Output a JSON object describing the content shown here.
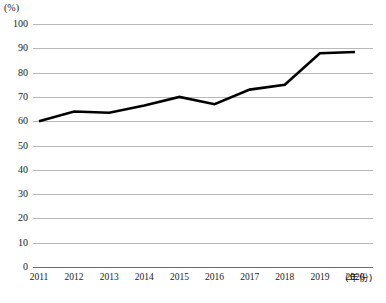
{
  "chart_data": {
    "type": "line",
    "title": "",
    "xlabel": "(年份)",
    "ylabel": "(%)",
    "categories": [
      "2011",
      "2012",
      "2013",
      "2014",
      "2015",
      "2016",
      "2017",
      "2018",
      "2019",
      "2020"
    ],
    "values": [
      60,
      64,
      63.5,
      66.5,
      70,
      67,
      73,
      75,
      88,
      88.5
    ],
    "ylim": [
      0,
      100
    ],
    "ytick_labels": [
      "100",
      "90",
      "80",
      "70",
      "60",
      "50",
      "40",
      "30",
      "20",
      "10",
      "0"
    ],
    "ytick_values": [
      100,
      90,
      80,
      70,
      60,
      50,
      40,
      30,
      20,
      10,
      0
    ],
    "grid": true,
    "legend": "none",
    "series_color": "#000000",
    "grid_color": "#b9b9b9",
    "axis_color": "#6d6d6d"
  }
}
